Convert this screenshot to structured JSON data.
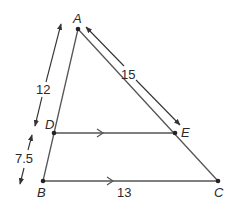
{
  "figure": {
    "points": {
      "A": {
        "label": "A",
        "x": 78,
        "y": 29
      },
      "B": {
        "label": "B",
        "x": 43,
        "y": 181
      },
      "C": {
        "label": "C",
        "x": 218,
        "y": 181
      },
      "D": {
        "label": "D",
        "x": 54,
        "y": 133
      },
      "E": {
        "label": "E",
        "x": 175,
        "y": 133
      }
    },
    "measures": {
      "AD": "12",
      "DB": "7.5",
      "AE": "15",
      "BC": "13"
    },
    "colors": {
      "line": "#555555",
      "point": "#222222",
      "text": "#2a2a2a"
    }
  }
}
